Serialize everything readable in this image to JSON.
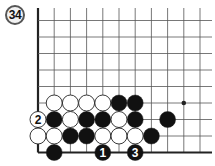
{
  "problem": {
    "number_label": "34"
  },
  "board": {
    "origin_x": 38,
    "origin_y": 20.5,
    "spacing_x": 16.2,
    "spacing_y": 16.5,
    "cols": 11,
    "rows": 9,
    "edges": {
      "left": true,
      "bottom": true,
      "top": false,
      "right": false
    },
    "colors": {
      "line": "#555555",
      "edge": "#222222",
      "black": "#111111",
      "white": "#ffffff",
      "stone_outline": "#222222"
    },
    "star_points": [
      {
        "col": 9,
        "row": 5
      }
    ],
    "stones": [
      {
        "col": 1,
        "row": 5,
        "color": "white"
      },
      {
        "col": 2,
        "row": 5,
        "color": "white"
      },
      {
        "col": 3,
        "row": 5,
        "color": "white"
      },
      {
        "col": 4,
        "row": 5,
        "color": "white"
      },
      {
        "col": 5,
        "row": 5,
        "color": "black"
      },
      {
        "col": 6,
        "row": 5,
        "color": "black"
      },
      {
        "col": 0,
        "row": 6,
        "color": "white",
        "label": "2"
      },
      {
        "col": 1,
        "row": 6,
        "color": "black"
      },
      {
        "col": 2,
        "row": 6,
        "color": "white"
      },
      {
        "col": 3,
        "row": 6,
        "color": "black"
      },
      {
        "col": 4,
        "row": 6,
        "color": "black"
      },
      {
        "col": 5,
        "row": 6,
        "color": "white"
      },
      {
        "col": 6,
        "row": 6,
        "color": "black"
      },
      {
        "col": 8,
        "row": 6,
        "color": "black"
      },
      {
        "col": 0,
        "row": 7,
        "color": "white"
      },
      {
        "col": 1,
        "row": 7,
        "color": "white"
      },
      {
        "col": 2,
        "row": 7,
        "color": "black"
      },
      {
        "col": 3,
        "row": 7,
        "color": "black"
      },
      {
        "col": 4,
        "row": 7,
        "color": "white"
      },
      {
        "col": 5,
        "row": 7,
        "color": "white"
      },
      {
        "col": 6,
        "row": 7,
        "color": "white"
      },
      {
        "col": 7,
        "row": 7,
        "color": "black"
      },
      {
        "col": 1,
        "row": 8,
        "color": "black"
      },
      {
        "col": 4,
        "row": 8,
        "color": "black",
        "label": "1"
      },
      {
        "col": 6,
        "row": 8,
        "color": "black",
        "label": "3"
      }
    ]
  }
}
